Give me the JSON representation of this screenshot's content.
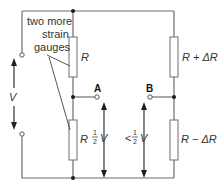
{
  "diagram": {
    "annotation": {
      "lines": [
        "two more",
        "strain",
        "gauges"
      ]
    },
    "supply": {
      "label": "V"
    },
    "resistors": {
      "top_left": "R",
      "bottom_left": "R",
      "top_right": "R + ΔR",
      "bottom_right": "R − ΔR"
    },
    "nodes": {
      "a": "A",
      "b": "B"
    },
    "voltages": {
      "a": {
        "prefix": "",
        "num": "1",
        "den": "2",
        "suffix": "V"
      },
      "b": {
        "prefix": "<",
        "num": "1",
        "den": "2",
        "suffix": "V"
      }
    },
    "colors": {
      "wire": "#6e6e6e",
      "text": "#333333"
    }
  }
}
